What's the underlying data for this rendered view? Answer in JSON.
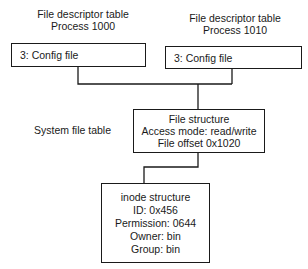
{
  "process_a": {
    "title": "File descriptor table",
    "subtitle": "Process 1000",
    "entry": "3: Config file"
  },
  "process_b": {
    "title": "File descriptor table",
    "subtitle": "Process 1010",
    "entry": "3: Config file"
  },
  "system_file_table": {
    "label": "System file table",
    "lines": [
      "File structure",
      "Access mode: read/write",
      "File offset 0x1020"
    ]
  },
  "inode": {
    "lines": [
      "inode structure",
      "ID: 0x456",
      "Permission: 0644",
      "Owner: bin",
      "Group: bin"
    ]
  },
  "colors": {
    "line": "#1a1a1a",
    "background": "#ffffff"
  }
}
